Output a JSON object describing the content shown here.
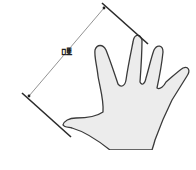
{
  "diagram": {
    "label": "뼘",
    "colors": {
      "outline": "#3a3a3a",
      "hand_fill": "#ececec",
      "dimension_line": "#555555",
      "background": "#ffffff"
    },
    "elements": [
      {
        "name": "hand-outline",
        "description": "Open right hand with fingers spread"
      },
      {
        "name": "top-boundary-line",
        "description": "Line touching middle fingertip"
      },
      {
        "name": "bottom-boundary-line",
        "description": "Line touching thumb tip"
      },
      {
        "name": "dimension-line",
        "description": "Span distance between boundary lines"
      }
    ]
  }
}
